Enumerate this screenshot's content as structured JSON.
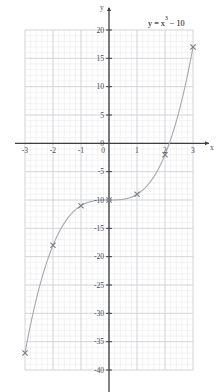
{
  "figure": {
    "equation_label": "y = x",
    "equation_exponent": "3",
    "equation_tail": " − 10",
    "x_axis_name": "x",
    "y_axis_name": "y",
    "grid_color": "#cfd2d6",
    "minor_grid_color": "#e4e6e9",
    "axis_color": "#3d3f43",
    "curve_color": "#a8a9ad",
    "marker_color": "#7c7d81"
  },
  "chart_data": {
    "type": "line",
    "xlabel": "x",
    "ylabel": "y",
    "xlim": [
      -3,
      3
    ],
    "ylim": [
      -40,
      20
    ],
    "grid": true,
    "minor_grid": true,
    "legend": "none",
    "x_ticks": [
      -3,
      -2,
      -1,
      0,
      1,
      2,
      3
    ],
    "x_tick_labels": [
      "-3",
      "-2",
      "-1",
      "0",
      "1",
      "2",
      "3"
    ],
    "y_ticks": [
      20,
      15,
      10,
      5,
      0,
      -5,
      -10,
      -15,
      -20,
      -25,
      -30,
      -35,
      -40
    ],
    "y_tick_labels": [
      "20",
      "15",
      "10",
      "5",
      "0",
      "-5",
      "-10",
      "-15",
      "-20",
      "-25",
      "-30",
      "-35",
      "-40"
    ],
    "series": [
      {
        "name": "y = x^3 - 10",
        "marker": "x",
        "x": [
          -3,
          -2,
          -1,
          0,
          1,
          2,
          3
        ],
        "values": [
          -37,
          -18,
          -11,
          -10,
          -9,
          -2,
          17
        ]
      }
    ]
  }
}
